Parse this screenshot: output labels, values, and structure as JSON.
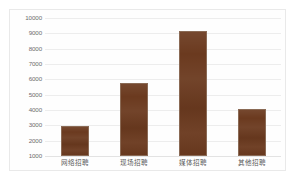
{
  "chart_data": {
    "type": "bar",
    "title": "",
    "subtitle": "",
    "xlabel": "",
    "ylabel": "",
    "categories": [
      "网络招聘",
      "现场招聘",
      "媒体招聘",
      "其他招聘"
    ],
    "values": [
      2950,
      5750,
      9150,
      4050
    ],
    "ylim": [
      1000,
      10000
    ],
    "ytick_step": 1000,
    "yticks": [
      1000,
      2000,
      3000,
      4000,
      5000,
      6000,
      7000,
      8000,
      9000,
      10000
    ],
    "ytick_labels": [
      "1000",
      "2000",
      "3000",
      "4000",
      "5000",
      "6000",
      "7000",
      "8000",
      "9000",
      "10000"
    ],
    "grid": true,
    "legend": false,
    "legend_position": "none",
    "bar_color": "#6B3A1F",
    "bar_border_color": "#8a6a55",
    "gridline_color": "#ededed",
    "background_color": "#ffffff",
    "panel_border_color": "#e9e9e9",
    "tick_text_color": "#6d6d6d",
    "category_text_color": "#5b5b5b"
  }
}
